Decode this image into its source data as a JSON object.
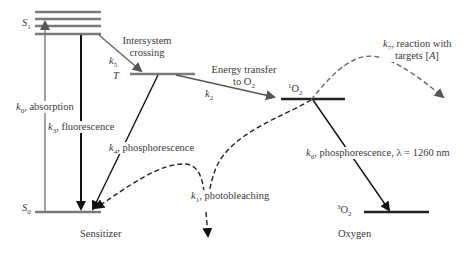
{
  "diagram": {
    "colors": {
      "level_gray": "#7a7a7a",
      "level_dark": "#222222",
      "arrow_dark": "#111111",
      "arrow_gray": "#555555",
      "text": "#3a3a3a"
    },
    "groups": {
      "sensitizer": "Sensitizer",
      "oxygen": "Oxygen"
    },
    "levels": {
      "s1": {
        "symbol": "S",
        "sub": "1"
      },
      "s0": {
        "symbol": "S",
        "sub": "0"
      },
      "t": {
        "symbol": "T"
      },
      "singlet_oxygen": {
        "sup": "1",
        "symbol": "O",
        "sub": "2"
      },
      "triplet_oxygen": {
        "sup": "3",
        "symbol": "O",
        "sub": "2"
      }
    },
    "processes": {
      "k0": {
        "k": "k",
        "sub": "0",
        "text": ", absorption"
      },
      "k3": {
        "k": "k",
        "sub": "3",
        "text": ", fluorescence"
      },
      "k5": {
        "k": "k",
        "sub": "5",
        "text_line1": "Intersystem",
        "text_line2": "crossing"
      },
      "k2": {
        "k": "k",
        "sub": "2",
        "text_line1": "Energy transfer",
        "text_line2_prefix": "to O",
        "text_line2_sub": "2"
      },
      "k4": {
        "k": "k",
        "sub": "4",
        "text": ", phosphorescence"
      },
      "k6": {
        "k": "k",
        "sub": "6",
        "text": ", phosphorescence, λ = 1260 nm"
      },
      "k7": {
        "k": "k",
        "sub": "7",
        "text_line1": ", reaction with",
        "text_line2": "targets [",
        "text_line2_var": "A",
        "text_line2_end": "]"
      },
      "k1": {
        "k": "k",
        "sub": "1",
        "text": ", photobleaching"
      }
    }
  }
}
